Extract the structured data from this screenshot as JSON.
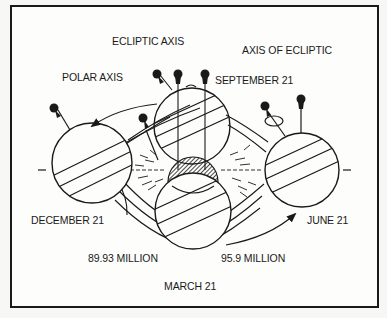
{
  "diagram": {
    "type": "earth-orbit-seasons",
    "colors": {
      "ink": "#1a1a1a",
      "paper": "#fdfdfb",
      "background": "#f7f7f5"
    },
    "labels": {
      "ecliptic_axis": "ECLIPTIC AXIS",
      "axis_of_ecliptic": "AXIS OF ECLIPTIC",
      "polar_axis": "POLAR AXIS",
      "september": "SEPTEMBER 21",
      "december": "DECEMBER 21",
      "june": "JUNE 21",
      "march": "MARCH 21",
      "distance_left": "89.93 MILLION",
      "distance_right": "95.9 MILLION"
    },
    "bodies": [
      {
        "name": "earth-december",
        "label": "DECEMBER 21"
      },
      {
        "name": "earth-september",
        "label": "SEPTEMBER 21"
      },
      {
        "name": "sun",
        "label": ""
      },
      {
        "name": "earth-march",
        "label": "MARCH 21"
      },
      {
        "name": "earth-june",
        "label": "JUNE 21"
      }
    ]
  }
}
